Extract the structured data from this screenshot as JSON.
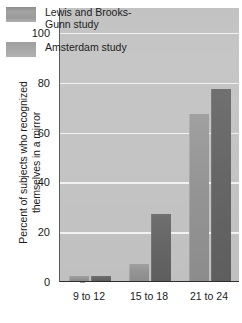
{
  "chart_data": {
    "type": "bar",
    "title": "",
    "xlabel": "",
    "ylabel": "Percent of subjects who recognized\nthemselves in a mirror",
    "categories": [
      "9 to 12",
      "15 to 18",
      "21 to 24"
    ],
    "series": [
      {
        "name": "Lewis and Brooks-\nGunn study",
        "values": [
          2,
          7,
          67
        ]
      },
      {
        "name": "Amsterdam study",
        "values": [
          2,
          27,
          77
        ]
      }
    ],
    "ylim": [
      0,
      110
    ],
    "yticks": [
      0,
      20,
      40,
      60,
      80,
      100
    ],
    "ytick_labels": [
      "0",
      "20",
      "40",
      "60",
      "80",
      "100"
    ],
    "grid": true,
    "legend_position": "top-left",
    "colors": {
      "series_0": "#949494",
      "series_1": "#666666",
      "plot_background": "#c4c4c4",
      "gridline": "#f2f2f2",
      "axis": "#2e2e2e",
      "text": "#1a1a1a"
    }
  }
}
